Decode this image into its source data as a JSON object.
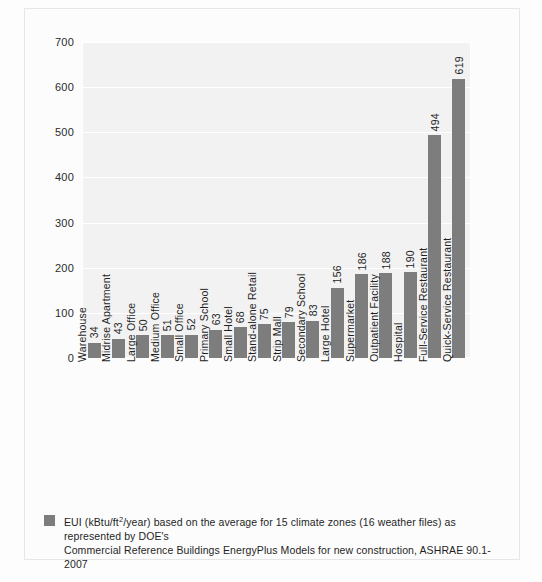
{
  "chart_data": {
    "type": "bar",
    "title": "",
    "xlabel": "",
    "ylabel": "",
    "ylim": [
      0,
      700
    ],
    "yticks": [
      700,
      600,
      500,
      400,
      300,
      200,
      100,
      0
    ],
    "grid": true,
    "legend_position": "bottom",
    "bar_color": "#7d7d7d",
    "plot_background": "#f2f2f2",
    "gridline_color": "#ffffff",
    "categories": [
      "Warehouse",
      "Midrise Apartment",
      "Large Office",
      "Medium Office",
      "Small Office",
      "Primary School",
      "Small Hotel",
      "Stand-alone Retail",
      "Strip Mall",
      "Secondary School",
      "Large Hotel",
      "Supermarket",
      "Outpatient Facility",
      "Hospital",
      "Full-Service Restaurant",
      "Quick-Service Restaurant"
    ],
    "values": [
      34,
      43,
      50,
      51,
      52,
      63,
      68,
      75,
      79,
      83,
      156,
      186,
      188,
      190,
      494,
      619
    ],
    "series": [
      {
        "name": "EUI (kBtu/ft²/year)",
        "values": [
          34,
          43,
          50,
          51,
          52,
          63,
          68,
          75,
          79,
          83,
          156,
          186,
          188,
          190,
          494,
          619
        ]
      }
    ]
  },
  "legend": {
    "line1_prefix": "EUI (kBtu/ft",
    "line1_sup": "2",
    "line1_suffix": "/year) based on the average for 15 climate zones (16 weather files) as represented by DOE's",
    "line2": "Commercial Reference Buildings EnergyPlus Models for new construction, ASHRAE 90.1-2007"
  }
}
